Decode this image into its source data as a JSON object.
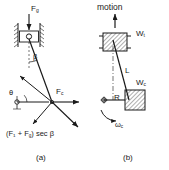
{
  "figure": {
    "caption_a": "(a)",
    "caption_b": "(b)",
    "background_color": "#ffffff",
    "line_color": "#1a1a1a"
  },
  "panel_a": {
    "name": "force-diagram-slider-crank",
    "labels": {
      "gas_force": "F",
      "gas_force_sub": "g",
      "crank_force": "F",
      "crank_force_sub": "c",
      "angle_beta": "β",
      "angle_theta": "θ",
      "resultant_expression": "(F₁ + F",
      "resultant_expression_sub": "g",
      "resultant_expression_tail": ") sec β"
    }
  },
  "panel_b": {
    "name": "crank-mass-diagram",
    "labels": {
      "motion": "motion",
      "weight_top": "W",
      "weight_top_sub": "t",
      "weight_crank": "W",
      "weight_crank_sub": "c",
      "rod_length": "L",
      "crank_radius": "R",
      "angular_velocity": "ω",
      "angular_velocity_sub": "c"
    }
  }
}
